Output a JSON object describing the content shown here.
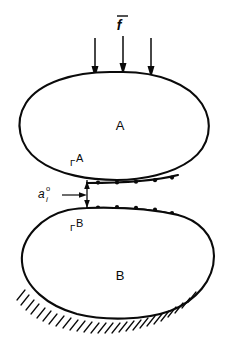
{
  "figure": {
    "background_color": "#ffffff",
    "ink_color": "#0a0a0a",
    "width": 236,
    "height": 350
  },
  "labels": {
    "body_a": "A",
    "body_b": "B",
    "interface_a_symbol": "Γ",
    "interface_a_superscript": "A",
    "interface_b_symbol": "Γ",
    "interface_b_superscript": "B",
    "force_symbol": "f",
    "force_accent": "overbar",
    "gap_symbol": "a",
    "gap_superscript": "o",
    "gap_subscript": "i"
  },
  "load": {
    "name": "distributed-traction",
    "arrow_count": 3,
    "direction": "downward",
    "arrow_x_positions": [
      95,
      123,
      151
    ],
    "arrow_top_y": 38,
    "label_text": "f"
  },
  "contact": {
    "upper_interface_nodes": 5,
    "lower_interface_nodes": 5,
    "upper_node_x": [
      98,
      117,
      136,
      155,
      172
    ],
    "lower_node_x": [
      98,
      117,
      136,
      155,
      172
    ],
    "gap_value_label": "a",
    "gap_top_y": 183,
    "gap_bottom_y": 206
  },
  "support": {
    "type": "fixed-ground-hatching",
    "tick_count": 26,
    "description": "hatched fixed boundary beneath body B"
  }
}
